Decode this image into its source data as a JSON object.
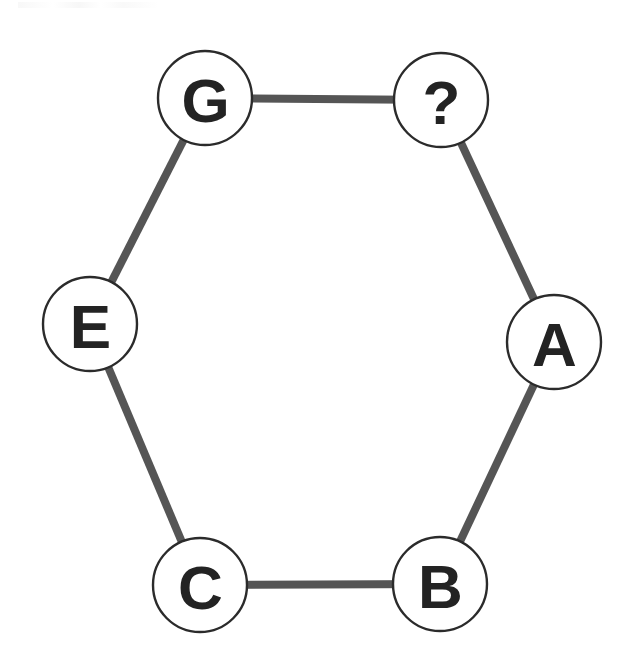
{
  "diagram": {
    "type": "hexagon-cycle-graph",
    "title": "",
    "background_color": "#ffffff",
    "edge_color": "#555555",
    "edge_width": 8,
    "node_fill": "#ffffff",
    "node_stroke": "#2b2b2b",
    "node_stroke_width": 2.4,
    "node_radius": 47,
    "label_color": "#232323",
    "nodes": [
      {
        "id": "node-g",
        "label": "G",
        "cx": 205,
        "cy": 98,
        "r": 47
      },
      {
        "id": "node-question",
        "label": "?",
        "cx": 441,
        "cy": 100,
        "r": 47
      },
      {
        "id": "node-a",
        "label": "A",
        "cx": 554,
        "cy": 342,
        "r": 47
      },
      {
        "id": "node-b",
        "label": "B",
        "cx": 440,
        "cy": 584,
        "r": 47
      },
      {
        "id": "node-c",
        "label": "C",
        "cx": 200,
        "cy": 585,
        "r": 47
      },
      {
        "id": "node-e",
        "label": "E",
        "cx": 90,
        "cy": 324,
        "r": 47
      }
    ],
    "edges": [
      {
        "id": "edge-g-question",
        "from": "node-g",
        "to": "node-question"
      },
      {
        "id": "edge-question-a",
        "from": "node-question",
        "to": "node-a"
      },
      {
        "id": "edge-a-b",
        "from": "node-a",
        "to": "node-b"
      },
      {
        "id": "edge-b-c",
        "from": "node-b",
        "to": "node-c"
      },
      {
        "id": "edge-c-e",
        "from": "node-c",
        "to": "node-e"
      },
      {
        "id": "edge-e-g",
        "from": "node-e",
        "to": "node-g"
      }
    ]
  }
}
